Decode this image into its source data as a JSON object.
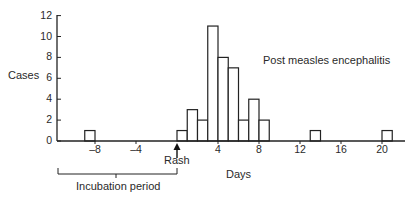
{
  "chart_data": {
    "type": "bar",
    "subtype": "histogram",
    "title": "",
    "annotation": "Post measles encephalitis",
    "xlabel": "Days",
    "ylabel": "Cases",
    "xlim": [
      -12,
      22
    ],
    "ylim": [
      0,
      12
    ],
    "grid": false,
    "legend": null,
    "x_ticks": [
      -8,
      -4,
      4,
      8,
      12,
      16,
      20
    ],
    "x_tick_labels": [
      "–8",
      "–4",
      "4",
      "8",
      "12",
      "16",
      "20"
    ],
    "y_ticks": [
      0,
      2,
      4,
      6,
      8,
      10,
      12
    ],
    "y_tick_labels": [
      "0",
      "2",
      "4",
      "6",
      "8",
      "10",
      "12"
    ],
    "bin_width": 1,
    "bins": [
      {
        "start": -9,
        "end": -8,
        "value": 1
      },
      {
        "start": 0,
        "end": 1,
        "value": 1
      },
      {
        "start": 1,
        "end": 2,
        "value": 3
      },
      {
        "start": 2,
        "end": 3,
        "value": 2
      },
      {
        "start": 3,
        "end": 4,
        "value": 11
      },
      {
        "start": 4,
        "end": 5,
        "value": 8
      },
      {
        "start": 5,
        "end": 6,
        "value": 7
      },
      {
        "start": 6,
        "end": 7,
        "value": 2
      },
      {
        "start": 7,
        "end": 8,
        "value": 4
      },
      {
        "start": 8,
        "end": 9,
        "value": 2
      },
      {
        "start": 13,
        "end": 14,
        "value": 1
      },
      {
        "start": 20,
        "end": 21,
        "value": 1
      }
    ],
    "markers": [
      {
        "label": "Rash",
        "x": 0,
        "type": "arrow"
      }
    ],
    "brackets": [
      {
        "label": "Incubation period",
        "from": -12,
        "to": 0
      }
    ]
  },
  "labels": {
    "ylabel": "Cases",
    "xlabel": "Days",
    "annotation": "Post measles encephalitis",
    "rash": "Rash",
    "incubation": "Incubation period"
  }
}
